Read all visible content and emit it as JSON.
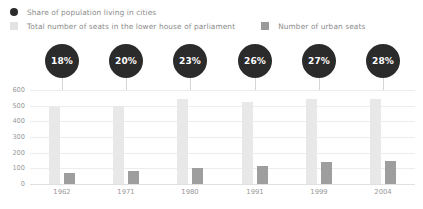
{
  "legend": {
    "items": [
      {
        "label": "Share of population living in cities",
        "icon": "dot-marker-icon",
        "color": "#2b2b2b",
        "shape": "dot"
      },
      {
        "label": "Total number of seats in the lower house of parliament",
        "icon": "square-swatch-icon",
        "color": "#e3e3e3",
        "shape": "square"
      },
      {
        "label": "Number of urban seats",
        "icon": "square-swatch-icon",
        "color": "#9a9a9a",
        "shape": "square"
      }
    ]
  },
  "chart_data": {
    "type": "bar",
    "title": "",
    "xlabel": "",
    "ylabel": "",
    "categories": [
      "1962",
      "1971",
      "1980",
      "1991",
      "1999",
      "2004"
    ],
    "ylim": [
      0,
      600
    ],
    "yticks": [
      600,
      500,
      400,
      300,
      200,
      100,
      0
    ],
    "grid": true,
    "legend_position": "top",
    "series": [
      {
        "name": "Total number of seats in the lower house of parliament",
        "color": "#e8e8e8",
        "values": [
          494,
          497,
          542,
          521,
          543,
          543
        ]
      },
      {
        "name": "Number of urban seats",
        "color": "#9e9e9e",
        "values": [
          70,
          85,
          105,
          118,
          140,
          145
        ]
      }
    ],
    "annotations": {
      "name": "Share of population living in cities",
      "color": "#2b2b2b",
      "labels": [
        "18%",
        "20%",
        "23%",
        "26%",
        "27%",
        "28%"
      ],
      "values": [
        18,
        20,
        23,
        26,
        27,
        28
      ]
    }
  }
}
